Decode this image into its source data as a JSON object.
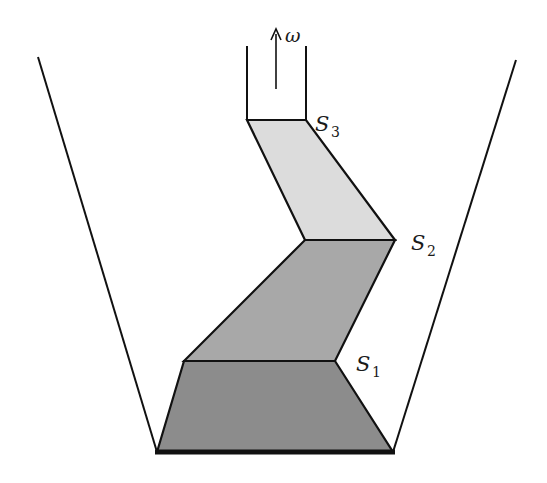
{
  "diagram": {
    "labels": {
      "omega": "ω",
      "s1_main": "S",
      "s1_sub": "1",
      "s2_main": "S",
      "s2_sub": "2",
      "s3_main": "S",
      "s3_sub": "3"
    },
    "colors": {
      "outline": "#111111",
      "region_bottom": "#8c8c8c",
      "region_middle": "#a8a8a8",
      "region_top": "#dcdcdc",
      "background": "#ffffff"
    },
    "regions": [
      {
        "name": "bottom-region",
        "between": [
          "base",
          "S1"
        ]
      },
      {
        "name": "middle-region",
        "between": [
          "S1",
          "S2"
        ]
      },
      {
        "name": "top-region",
        "between": [
          "S2",
          "S3"
        ]
      }
    ],
    "arrow": {
      "direction": "up",
      "label": "ω"
    }
  }
}
